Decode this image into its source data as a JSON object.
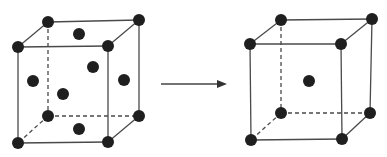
{
  "diagram": {
    "colors": {
      "atom": "#1f1f1f",
      "edge": "#4a4a4a",
      "background": "#ffffff"
    },
    "cubes": [
      {
        "id": "fcc",
        "label": "face-centered cubic",
        "corners": {
          "front_tl": [
            18,
            47
          ],
          "front_tr": [
            108,
            46
          ],
          "front_bl": [
            18,
            143
          ],
          "front_br": [
            108,
            142
          ],
          "back_tl": [
            48,
            22
          ],
          "back_tr": [
            139,
            20
          ],
          "back_bl": [
            48,
            116
          ],
          "back_br": [
            139,
            116
          ]
        },
        "interior_atoms": [
          [
            79,
            34
          ],
          [
            33,
            81
          ],
          [
            93,
            67
          ],
          [
            63,
            94
          ],
          [
            124,
            80
          ],
          [
            79,
            129
          ]
        ]
      },
      {
        "id": "bcc",
        "label": "body-centered cubic",
        "corners": {
          "front_tl": [
            250,
            44
          ],
          "front_tr": [
            341,
            44
          ],
          "front_bl": [
            251,
            140
          ],
          "front_br": [
            342,
            139
          ],
          "back_tl": [
            281,
            20
          ],
          "back_tr": [
            372,
            19
          ],
          "back_bl": [
            281,
            113
          ],
          "back_br": [
            370,
            113
          ]
        },
        "interior_atoms": [
          [
            309,
            81
          ]
        ]
      }
    ],
    "arrow": {
      "from": [
        161,
        84
      ],
      "to": [
        227,
        84
      ],
      "direction": "right"
    },
    "atom_radius": 6
  }
}
